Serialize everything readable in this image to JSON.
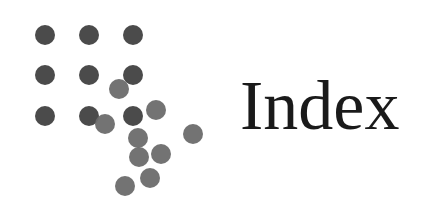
{
  "title": "Index",
  "logo": {
    "dark_color": "#4b4b4b",
    "light_color": "#6b6b6b",
    "radius": 10,
    "grid_dots": [
      [
        45,
        35
      ],
      [
        89,
        35
      ],
      [
        133,
        35
      ],
      [
        45,
        75
      ],
      [
        89,
        75
      ],
      [
        133,
        75
      ],
      [
        45,
        116
      ],
      [
        89,
        116
      ],
      [
        133,
        116
      ]
    ],
    "scattered_dots": [
      [
        119,
        89
      ],
      [
        156,
        110
      ],
      [
        105,
        124
      ],
      [
        138,
        138
      ],
      [
        193,
        134
      ],
      [
        139,
        157
      ],
      [
        161,
        154
      ],
      [
        150,
        178
      ],
      [
        125,
        186
      ]
    ]
  }
}
